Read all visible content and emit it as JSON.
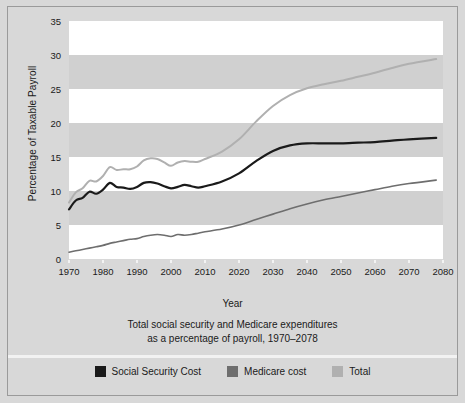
{
  "figure": {
    "background_color": "#d8d8d8",
    "border_color": "#9a9a9a",
    "x_axis_title": "Year",
    "y_axis_title": "Percentage of Taxable Payroll",
    "caption_line1": "Total social security and Medicare expenditures",
    "caption_line2": "as a percentage of payroll, 1970–2078"
  },
  "legend": {
    "items": [
      {
        "label": "Social Security Cost",
        "color": "#1a1a1a"
      },
      {
        "label": "Medicare cost",
        "color": "#6e6e6e"
      },
      {
        "label": "Total",
        "color": "#b0b0b0"
      }
    ]
  },
  "chart_data": {
    "type": "line",
    "title": "Total social security and Medicare expenditures as a percentage of payroll, 1970–2078",
    "xlabel": "Year",
    "ylabel": "Percentage of Taxable Payroll",
    "xlim": [
      1970,
      2080
    ],
    "ylim": [
      0,
      35
    ],
    "xticks": [
      1970,
      1980,
      1990,
      2000,
      2010,
      2020,
      2030,
      2040,
      2050,
      2060,
      2070,
      2080
    ],
    "yticks": [
      0,
      5,
      10,
      15,
      20,
      25,
      30,
      35
    ],
    "grid": false,
    "banding": "alternating horizontal bands every 5 units; white on 0-5, 10-15, 20-25, 30-35; light gray on 5-10, 15-20, 25-30",
    "legend_position": "below plot, centered",
    "data_end_year": 2078,
    "x": [
      1970,
      1972,
      1974,
      1976,
      1978,
      1980,
      1982,
      1984,
      1986,
      1988,
      1990,
      1992,
      1994,
      1996,
      1998,
      2000,
      2002,
      2004,
      2006,
      2008,
      2010,
      2015,
      2020,
      2025,
      2030,
      2035,
      2040,
      2045,
      2050,
      2055,
      2060,
      2065,
      2070,
      2078
    ],
    "series": [
      {
        "name": "Social Security Cost",
        "color": "#1a1a1a",
        "linewidth": 2.2,
        "values": [
          7.3,
          8.6,
          9.0,
          9.9,
          9.6,
          10.2,
          11.2,
          10.6,
          10.5,
          10.3,
          10.6,
          11.2,
          11.3,
          11.1,
          10.7,
          10.4,
          10.6,
          10.9,
          10.7,
          10.5,
          10.7,
          11.4,
          12.6,
          14.4,
          15.9,
          16.7,
          17.0,
          17.0,
          17.0,
          17.1,
          17.2,
          17.4,
          17.6,
          17.8
        ]
      },
      {
        "name": "Medicare cost",
        "color": "#6e6e6e",
        "linewidth": 1.6,
        "values": [
          1.0,
          1.2,
          1.4,
          1.6,
          1.8,
          2.0,
          2.3,
          2.5,
          2.7,
          2.9,
          3.0,
          3.3,
          3.5,
          3.6,
          3.5,
          3.3,
          3.6,
          3.5,
          3.6,
          3.8,
          4.0,
          4.4,
          5.0,
          5.8,
          6.6,
          7.4,
          8.1,
          8.7,
          9.2,
          9.7,
          10.2,
          10.7,
          11.1,
          11.6
        ]
      },
      {
        "name": "Total",
        "color": "#b0b0b0",
        "linewidth": 2.0,
        "values": [
          8.3,
          9.8,
          10.4,
          11.5,
          11.4,
          12.2,
          13.5,
          13.1,
          13.2,
          13.2,
          13.6,
          14.5,
          14.8,
          14.7,
          14.2,
          13.7,
          14.2,
          14.4,
          14.3,
          14.3,
          14.7,
          15.8,
          17.6,
          20.2,
          22.5,
          24.1,
          25.1,
          25.7,
          26.2,
          26.8,
          27.4,
          28.1,
          28.7,
          29.4
        ]
      }
    ]
  }
}
